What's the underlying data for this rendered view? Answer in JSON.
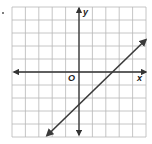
{
  "chart_data": {
    "type": "line",
    "title": "",
    "xlabel": "x",
    "ylabel": "y",
    "origin_label": "O",
    "xlim": [
      -5,
      5
    ],
    "ylim": [
      -5,
      5
    ],
    "grid": true,
    "grid_step": 1,
    "tick_labels_shown": false,
    "series": [
      {
        "name": "line",
        "equation": "y = x - 2.5",
        "slope": 1,
        "x_intercept": 2.5,
        "y_intercept": -2.5,
        "points": [
          [
            -2.4,
            -4.9
          ],
          [
            5,
            2.5
          ]
        ],
        "arrows_both_ends": true
      }
    ],
    "colors": {
      "grid": "#b8b8b8",
      "axes": "#333333",
      "line": "#3a3a3a"
    }
  },
  "labels": {
    "x_axis": "x",
    "y_axis": "y",
    "origin": "O"
  }
}
